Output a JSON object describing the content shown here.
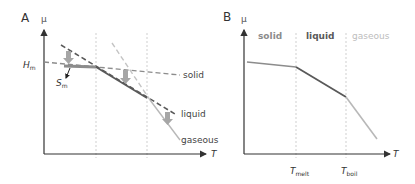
{
  "panels": {
    "a": {
      "label": "A",
      "y_axis_label": "μ",
      "x_axis_label": "T",
      "hm_label": "H",
      "hm_sub": "m",
      "sm_label": "S",
      "sm_sub": "m",
      "solid_label": "solid",
      "liquid_label": "liquid",
      "gaseous_label": "gaseous"
    },
    "b": {
      "label": "B",
      "y_axis_label": "μ",
      "x_axis_label": "T",
      "region_solid": "solid",
      "region_liquid": "liquid",
      "region_gaseous": "gaseous",
      "tmelt_label": "T",
      "tmelt_sub": "melt",
      "tboil_label": "T",
      "tboil_sub": "boil"
    }
  },
  "colors": {
    "axis": "#333333",
    "solid_phase": "#8c8c8c",
    "liquid_phase": "#595959",
    "gaseous_phase": "#b8b8b8",
    "guide": "#cfcfcf",
    "arrow_fill": "#a6a6a6"
  }
}
